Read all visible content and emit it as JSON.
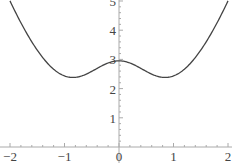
{
  "chart_data": {
    "type": "line",
    "title": "",
    "xlabel": "",
    "ylabel": "",
    "xlim": [
      -2,
      2
    ],
    "ylim": [
      0,
      5
    ],
    "grid": false,
    "legend": null,
    "x_ticks": [
      -2,
      -1,
      0,
      1,
      2
    ],
    "x_tick_labels": [
      "−2",
      "−1",
      "0",
      "1",
      "2"
    ],
    "y_ticks": [
      1,
      2,
      3,
      4,
      5
    ],
    "y_tick_labels": [
      "1",
      "2",
      "3",
      "4",
      "5"
    ],
    "series": [
      {
        "name": "f(x)",
        "color": "#444444",
        "x": [
          -2.0,
          -1.75,
          -1.5,
          -1.25,
          -1.0,
          -0.85,
          -0.75,
          -0.5,
          -0.25,
          0.0,
          0.25,
          0.5,
          0.75,
          0.85,
          1.0,
          1.25,
          1.5,
          1.75,
          2.0
        ],
        "y": [
          5.0,
          4.07,
          3.27,
          2.68,
          2.43,
          2.38,
          2.39,
          2.59,
          2.84,
          2.95,
          2.84,
          2.59,
          2.39,
          2.38,
          2.43,
          2.68,
          3.27,
          4.07,
          5.0
        ]
      }
    ]
  }
}
